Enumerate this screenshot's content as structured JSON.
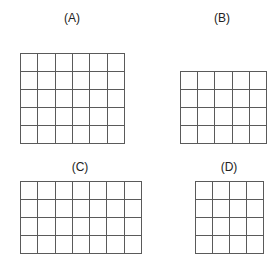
{
  "figures": [
    {
      "id": "A",
      "label": "(A)",
      "cols": 6,
      "rows": 5,
      "x": 20,
      "y": 53,
      "w": 105,
      "h": 91,
      "label_x": 52,
      "label_y": 11
    },
    {
      "id": "B",
      "label": "(B)",
      "cols": 5,
      "rows": 4,
      "x": 180,
      "y": 71,
      "w": 87,
      "h": 73,
      "label_x": 202,
      "label_y": 11
    },
    {
      "id": "C",
      "label": "(C)",
      "cols": 7,
      "rows": 4,
      "x": 20,
      "y": 181,
      "w": 122,
      "h": 73,
      "label_x": 60,
      "label_y": 160
    },
    {
      "id": "D",
      "label": "(D)",
      "cols": 4,
      "rows": 4,
      "x": 195,
      "y": 181,
      "w": 69,
      "h": 73,
      "label_x": 209,
      "label_y": 160
    }
  ],
  "line_color": "#5a5a5a"
}
